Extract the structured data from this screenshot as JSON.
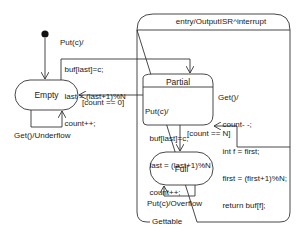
{
  "diagram": {
    "type": "uml-state-machine",
    "colors": {
      "stroke": "#333333",
      "text": "#1a1a1a",
      "background": "#ffffff"
    },
    "initial": {
      "target": "Empty"
    },
    "composite_state": {
      "name": "Gettable",
      "entry_action": "entry/OutputISR^interrupt"
    },
    "states": {
      "empty": {
        "name": "Empty"
      },
      "partial": {
        "name": "Partial",
        "internal": [
          "Put(c)/",
          "  buf[last]=c;",
          "  last = (last+1)%N",
          "  count++;"
        ]
      },
      "full": {
        "name": "Full"
      }
    },
    "transitions": {
      "put_from_empty": {
        "lines": [
          "Put(c)/",
          "  buf[last]=c;",
          "  last = (last+1)%N",
          "  count++;"
        ],
        "from": "Empty",
        "to": "Partial"
      },
      "count_zero": {
        "label": "[count == 0]",
        "from": "Gettable",
        "to": "Empty"
      },
      "get": {
        "lines": [
          "Get()/",
          "  count- -;",
          "  int f = first;",
          "  first = (first+1)%N;",
          "  return buf[f];"
        ],
        "from": "Gettable",
        "to": "Partial"
      },
      "count_n": {
        "label": "[count == N]",
        "from": "Partial",
        "to": "Full"
      },
      "underflow": {
        "label": "Get()/Underflow",
        "from": "Empty",
        "to": "Empty"
      },
      "overflow": {
        "label": "Put(c)/Overflow",
        "from": "Full",
        "to": "Full"
      }
    }
  }
}
